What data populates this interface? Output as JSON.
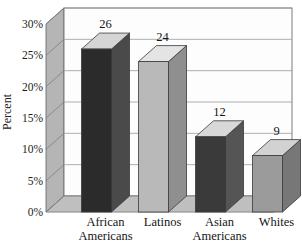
{
  "chart_data": {
    "type": "bar",
    "title": "",
    "subtitle": "",
    "xlabel": "",
    "ylabel": "Percent",
    "categories": [
      "African Americans",
      "Latinos",
      "Asian Americans",
      "Whites"
    ],
    "category_lines": [
      [
        "African",
        "Americans"
      ],
      [
        "Latinos",
        ""
      ],
      [
        "Asian",
        "Americans"
      ],
      [
        "Whites",
        ""
      ]
    ],
    "values": [
      26,
      24,
      12,
      9
    ],
    "value_labels": [
      "26",
      "24",
      "12",
      "9"
    ],
    "ylim": [
      0,
      30
    ],
    "ytick_values": [
      0,
      5,
      10,
      15,
      20,
      25,
      30
    ],
    "ytick_labels": [
      "0%",
      "5%",
      "10%",
      "15%",
      "20%",
      "25%",
      "30%"
    ],
    "grid": true,
    "legend": "none",
    "style": "3d-bar",
    "bar_colors": [
      "#2b2b2b",
      "#b9b9b9",
      "#3a3a3a",
      "#9b9b9b"
    ],
    "bar_top_colors": [
      "#d5d5d5",
      "#e4e4e4",
      "#d8d8d8",
      "#d2d2d2"
    ],
    "bar_side_colors": [
      "#4a4a4a",
      "#8f8f8f",
      "#555555",
      "#777777"
    ],
    "plot_background": "#fdfdfd",
    "wall_color": "#b5b5b5",
    "floor_color": "#c2c2c2",
    "grid_color": "#9a9a9a",
    "axis_color": "#555555"
  }
}
